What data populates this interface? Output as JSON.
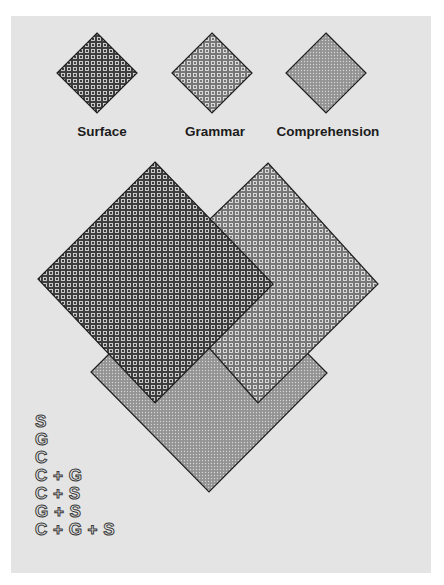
{
  "legend": [
    {
      "key": "S",
      "label": "Surface",
      "pattern": "dark-grid",
      "fill": "#4a4a4a"
    },
    {
      "key": "G",
      "label": "Grammar",
      "pattern": "medium-grid",
      "fill": "#7a7a7a"
    },
    {
      "key": "C",
      "label": "Comprehension",
      "pattern": "fine-dots",
      "fill": "#9c9c9c"
    }
  ],
  "diagram": {
    "shapes": [
      {
        "name": "surface",
        "points": "155,162 273,284 155,403 38,279"
      },
      {
        "name": "grammar",
        "points": "268,163 378,284 258,403 148,279"
      },
      {
        "name": "comprehension",
        "points": "209,254 327,373 209,492 91,372"
      }
    ]
  },
  "combinations": [
    "S",
    "G",
    "C",
    "C + G",
    "C + S",
    "G + S",
    "C + G + S"
  ],
  "colors": {
    "panel": "#e4e4e4",
    "outline": "#1e1e1e",
    "surface": "#4a4a4a",
    "grammar": "#7a7a7a",
    "comprehension": "#9c9c9c"
  }
}
